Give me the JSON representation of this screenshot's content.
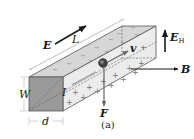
{
  "figure": {
    "caption": "(a)"
  },
  "labels": {
    "E": "E",
    "L": "L",
    "E_H_main": "E",
    "E_H_sub": "H",
    "v": "v",
    "B": "B",
    "F": "F",
    "I": "I",
    "W": "W",
    "d": "d"
  },
  "charges": {
    "top_face_sign": "−",
    "side_face_sign": "+",
    "v_plus": "+"
  },
  "colors": {
    "front_face": "#9a9a9a",
    "top_face": "#d6d6d6",
    "side_face": "#ececec",
    "edge": "#555555",
    "arrow": "#1a1a1a",
    "gray_arrow": "#666666",
    "dim_line": "#bdbdbd",
    "particle": "#444444"
  }
}
